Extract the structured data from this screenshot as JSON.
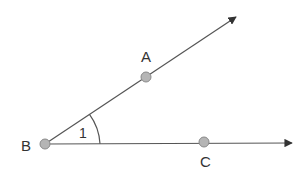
{
  "diagram": {
    "type": "angle",
    "vertex": {
      "label": "B",
      "x": 45,
      "y": 144
    },
    "rays": [
      {
        "name": "BA",
        "through": "A",
        "end": {
          "x": 236,
          "y": 17
        }
      },
      {
        "name": "BC",
        "through": "C",
        "end": {
          "x": 292,
          "y": 143
        }
      }
    ],
    "points": [
      {
        "label": "A",
        "x": 146,
        "y": 77,
        "label_x": 146,
        "label_y": 62
      },
      {
        "label": "B",
        "x": 45,
        "y": 144,
        "label_x": 26,
        "label_y": 151
      },
      {
        "label": "C",
        "x": 204,
        "y": 142,
        "label_x": 206,
        "label_y": 167
      }
    ],
    "angle_label": "1",
    "colors": {
      "line": "#555555",
      "point_fill": "#b5b5b5",
      "point_stroke": "#8a8a8a",
      "text": "#333333"
    }
  }
}
